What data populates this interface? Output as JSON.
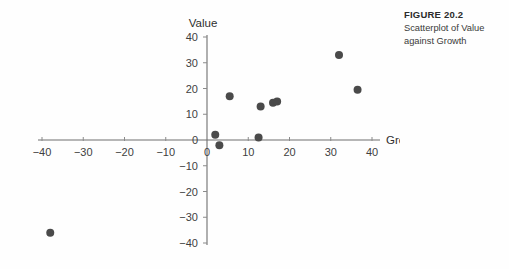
{
  "caption": {
    "figure_number": "FIGURE 20.2",
    "description_line_1": "Scatterplot of Value",
    "description_line_2": "against Growth"
  },
  "colors": {
    "point": "#4a4a4a",
    "axis": "#6e6e6e",
    "text": "#3f3f3f",
    "background": "#fefefe"
  },
  "chart_data": {
    "type": "scatter",
    "title": "",
    "xlabel": "Growth",
    "ylabel": "Value",
    "xlim": [
      -40,
      40
    ],
    "ylim": [
      -40,
      40
    ],
    "grid": false,
    "legend": null,
    "xticks": [
      -40,
      -30,
      -20,
      -10,
      0,
      10,
      20,
      30,
      40
    ],
    "xtick_labels": [
      "−40",
      "−30",
      "−20",
      "−10",
      "0",
      "10",
      "20",
      "30",
      "40"
    ],
    "yticks": [
      40,
      30,
      20,
      10,
      0,
      -10,
      -20,
      -30,
      -40
    ],
    "ytick_labels": [
      "40",
      "30",
      "20",
      "10",
      "0",
      "−10",
      "−20",
      "−30",
      "−40"
    ],
    "series": [
      {
        "name": "Value vs Growth",
        "marker": "circle",
        "marker_size": 4,
        "points": [
          {
            "x": -38.0,
            "y": -36.0
          },
          {
            "x": 2.0,
            "y": 2.0
          },
          {
            "x": 3.0,
            "y": -2.0
          },
          {
            "x": 5.5,
            "y": 17.0
          },
          {
            "x": 12.5,
            "y": 1.0
          },
          {
            "x": 13.0,
            "y": 13.0
          },
          {
            "x": 16.0,
            "y": 14.5
          },
          {
            "x": 17.0,
            "y": 15.0
          },
          {
            "x": 32.0,
            "y": 33.0
          },
          {
            "x": 36.5,
            "y": 19.5
          }
        ]
      }
    ]
  }
}
